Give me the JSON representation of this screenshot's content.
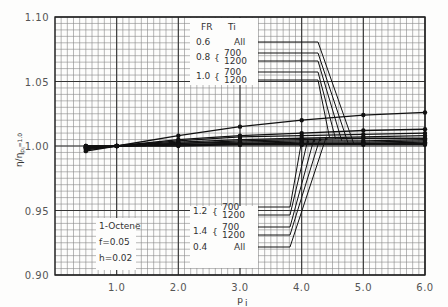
{
  "chart_data": {
    "type": "line",
    "title": "",
    "xlabel": "p_i",
    "ylabel": "η/η_{p_i=1.0}",
    "xlim": [
      0.0,
      6.0
    ],
    "ylim": [
      0.9,
      1.1
    ],
    "x_ticks": [
      "1.0",
      "2.0",
      "3.0",
      "4.0",
      "5.0",
      "6.0"
    ],
    "y_ticks": [
      "0.90",
      "0.95",
      "1.00",
      "1.05",
      "1.10"
    ],
    "grid": true,
    "x": [
      0.5,
      1.0,
      2.0,
      3.0,
      4.0,
      5.0,
      6.0
    ],
    "series": [
      {
        "name": "F_R=0.4, T_i=All",
        "values": [
          0.996,
          1.0,
          1.008,
          1.015,
          1.02,
          1.024,
          1.026
        ]
      },
      {
        "name": "F_R=1.4, T_i=1200",
        "values": [
          0.997,
          1.0,
          1.005,
          1.008,
          1.01,
          1.012,
          1.013
        ]
      },
      {
        "name": "F_R=1.4, T_i=700",
        "values": [
          0.998,
          1.0,
          1.004,
          1.007,
          1.008,
          1.009,
          1.01
        ]
      },
      {
        "name": "F_R=1.2, T_i=1200",
        "values": [
          0.998,
          1.0,
          1.003,
          1.005,
          1.006,
          1.007,
          1.008
        ]
      },
      {
        "name": "F_R=1.2, T_i=700",
        "values": [
          0.999,
          1.0,
          1.002,
          1.004,
          1.005,
          1.006,
          1.006
        ]
      },
      {
        "name": "F_R=1.0, T_i=1200",
        "values": [
          0.999,
          1.0,
          1.002,
          1.003,
          1.004,
          1.004,
          1.005
        ]
      },
      {
        "name": "F_R=1.0, T_i=700",
        "values": [
          0.999,
          1.0,
          1.001,
          1.002,
          1.003,
          1.003,
          1.004
        ]
      },
      {
        "name": "F_R=0.8, T_i=1200",
        "values": [
          1.0,
          1.0,
          1.001,
          1.002,
          1.002,
          1.002,
          1.003
        ]
      },
      {
        "name": "F_R=0.8, T_i=700",
        "values": [
          1.0,
          1.0,
          1.001,
          1.001,
          1.001,
          1.002,
          1.002
        ]
      },
      {
        "name": "F_R=0.6, T_i=All",
        "values": [
          1.0,
          1.0,
          1.0,
          1.001,
          1.001,
          1.001,
          1.001
        ]
      }
    ],
    "legend_top": {
      "header": {
        "fr": "F_R",
        "ti": "T_i"
      },
      "rows": [
        {
          "fr": "0.6",
          "ti": [
            "All"
          ]
        },
        {
          "fr": "0.8",
          "ti": [
            "700",
            "1200"
          ]
        },
        {
          "fr": "1.0",
          "ti": [
            "700",
            "1200"
          ]
        }
      ]
    },
    "legend_bottom": {
      "rows": [
        {
          "fr": "1.2",
          "ti": [
            "700",
            "1200"
          ]
        },
        {
          "fr": "1.4",
          "ti": [
            "700",
            "1200"
          ]
        },
        {
          "fr": "0.4",
          "ti": [
            "All"
          ]
        }
      ]
    },
    "annotation": [
      "1-Octene",
      "f=0.05",
      "h=0.02"
    ]
  }
}
